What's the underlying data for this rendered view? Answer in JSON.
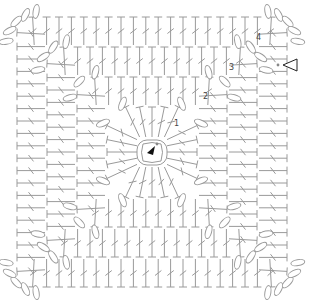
{
  "round_labels": [
    "1",
    "2",
    "3",
    "4"
  ],
  "symbols": {
    "start_marker": "filled-arrow-icon",
    "join_marker": "open-triangle-arrow-icon",
    "stitch": "double-crochet",
    "chain": "chain-oval",
    "slip_stitch": "dot"
  },
  "structure": {
    "rounds": 4,
    "center": "magic-ring",
    "corner_chains_per_round": [
      2,
      3,
      4,
      5
    ]
  },
  "colors": {
    "stitch": "#9a9a9a",
    "marker": "#111111",
    "label": "#444444"
  }
}
